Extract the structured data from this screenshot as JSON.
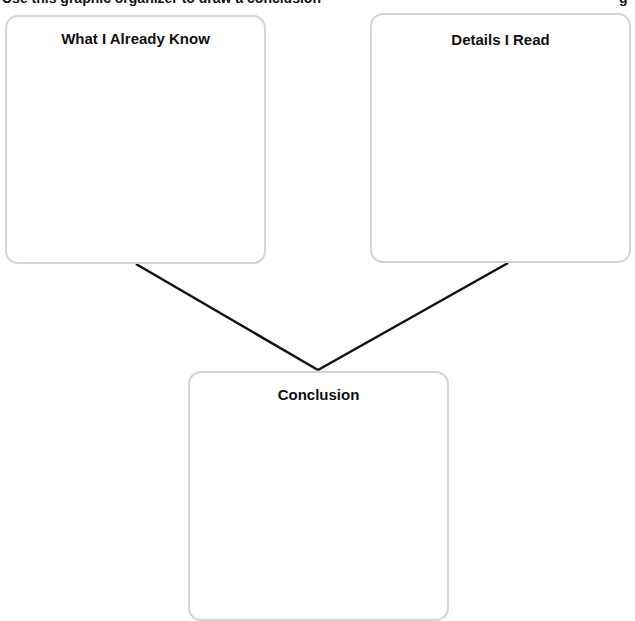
{
  "instruction": {
    "text": "Use this graphic organizer to draw a conclusion",
    "tail": "g"
  },
  "organizer": {
    "boxes": [
      {
        "id": "known",
        "title": "What I Already Know",
        "content": ""
      },
      {
        "id": "details",
        "title": "Details I Read",
        "content": ""
      },
      {
        "id": "conclusion",
        "title": "Conclusion",
        "content": ""
      }
    ]
  },
  "colors": {
    "box_border": "#d4d4d4",
    "connector": "#111111",
    "text": "#111111"
  }
}
